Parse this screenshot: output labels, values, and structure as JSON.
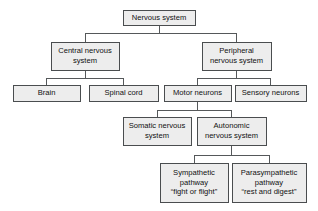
{
  "diagram": {
    "type": "hierarchy-tree",
    "style": {
      "box_fill": "#ededed",
      "box_border": "#4a4d4f",
      "connector": "#55585a",
      "text": "#111111",
      "background": "#ffffff"
    },
    "nodes": [
      {
        "id": "nervous-system",
        "lines": [
          "Nervous system"
        ],
        "level": 0,
        "box": {
          "x": 123,
          "y": 10,
          "w": 72,
          "h": 15
        }
      },
      {
        "id": "central-nervous-system",
        "lines": [
          "Central nervous",
          "system"
        ],
        "level": 1,
        "box": {
          "x": 51,
          "y": 42,
          "w": 68,
          "h": 28
        }
      },
      {
        "id": "peripheral-nervous-system",
        "lines": [
          "Peripheral",
          "nervous system"
        ],
        "level": 1,
        "box": {
          "x": 202,
          "y": 42,
          "w": 69,
          "h": 28
        }
      },
      {
        "id": "brain",
        "lines": [
          "Brain"
        ],
        "level": 2,
        "box": {
          "x": 13,
          "y": 85,
          "w": 67,
          "h": 16
        }
      },
      {
        "id": "spinal-cord",
        "lines": [
          "Spinal cord"
        ],
        "level": 2,
        "box": {
          "x": 89,
          "y": 85,
          "w": 69,
          "h": 16
        }
      },
      {
        "id": "motor-neurons",
        "lines": [
          "Motor neurons"
        ],
        "level": 2,
        "box": {
          "x": 164,
          "y": 85,
          "w": 67,
          "h": 16
        }
      },
      {
        "id": "sensory-neurons",
        "lines": [
          "Sensory neurons"
        ],
        "level": 2,
        "box": {
          "x": 235,
          "y": 85,
          "w": 71,
          "h": 16
        }
      },
      {
        "id": "somatic-nervous-system",
        "lines": [
          "Somatic nervous",
          "system"
        ],
        "level": 3,
        "box": {
          "x": 123,
          "y": 117,
          "w": 68,
          "h": 28
        }
      },
      {
        "id": "autonomic-nervous-system",
        "lines": [
          "Autonomic",
          "nervous system"
        ],
        "level": 3,
        "box": {
          "x": 197,
          "y": 117,
          "w": 69,
          "h": 28
        }
      },
      {
        "id": "sympathetic-pathway",
        "lines": [
          "Sympathetic",
          "pathway",
          "“fight or flight”"
        ],
        "level": 4,
        "box": {
          "x": 160,
          "y": 163,
          "w": 68,
          "h": 39
        }
      },
      {
        "id": "parasympathetic-pathway",
        "lines": [
          "Parasympathetic",
          "pathway",
          "“rest and digest”"
        ],
        "level": 4,
        "box": {
          "x": 232,
          "y": 163,
          "w": 74,
          "h": 39
        }
      }
    ],
    "connectors": [
      {
        "id": "root-stem",
        "from": "nervous-system",
        "path": "M159,25 L159,33"
      },
      {
        "id": "root-bus",
        "from": "nervous-system",
        "path": "M85,33 L236,33"
      },
      {
        "id": "root-to-cns",
        "from": "nervous-system",
        "to": "central-nervous-system",
        "path": "M85,33 L85,42"
      },
      {
        "id": "root-to-pns",
        "from": "nervous-system",
        "to": "peripheral-nervous-system",
        "path": "M236,33 L236,42"
      },
      {
        "id": "cns-stem",
        "from": "central-nervous-system",
        "path": "M85,70 L85,78"
      },
      {
        "id": "cns-bus",
        "from": "central-nervous-system",
        "path": "M46,78 L123,78"
      },
      {
        "id": "cns-to-brain",
        "from": "central-nervous-system",
        "to": "brain",
        "path": "M46,78 L46,85"
      },
      {
        "id": "cns-to-spinal-cord",
        "from": "central-nervous-system",
        "to": "spinal-cord",
        "path": "M123,78 L123,85"
      },
      {
        "id": "pns-stem",
        "from": "peripheral-nervous-system",
        "path": "M236,70 L236,78"
      },
      {
        "id": "pns-bus",
        "from": "peripheral-nervous-system",
        "path": "M197,78 L270,78"
      },
      {
        "id": "pns-to-motor",
        "from": "peripheral-nervous-system",
        "to": "motor-neurons",
        "path": "M197,78 L197,85"
      },
      {
        "id": "pns-to-sensory",
        "from": "peripheral-nervous-system",
        "to": "sensory-neurons",
        "path": "M270,78 L270,85"
      },
      {
        "id": "motor-stem",
        "from": "motor-neurons",
        "path": "M197,101 L197,110"
      },
      {
        "id": "motor-bus",
        "from": "motor-neurons",
        "path": "M157,110 L231,110"
      },
      {
        "id": "motor-to-somatic",
        "from": "motor-neurons",
        "to": "somatic-nervous-system",
        "path": "M157,110 L157,117"
      },
      {
        "id": "motor-to-autonomic",
        "from": "motor-neurons",
        "to": "autonomic-nervous-system",
        "path": "M231,110 L231,117"
      },
      {
        "id": "autonomic-stem",
        "from": "autonomic-nervous-system",
        "path": "M231,145 L231,155"
      },
      {
        "id": "autonomic-bus",
        "from": "autonomic-nervous-system",
        "path": "M194,155 L269,155"
      },
      {
        "id": "autonomic-to-sympathetic",
        "from": "autonomic-nervous-system",
        "to": "sympathetic-pathway",
        "path": "M194,155 L194,163"
      },
      {
        "id": "autonomic-to-parasympathetic",
        "from": "autonomic-nervous-system",
        "to": "parasympathetic-pathway",
        "path": "M269,155 L269,163"
      }
    ]
  }
}
